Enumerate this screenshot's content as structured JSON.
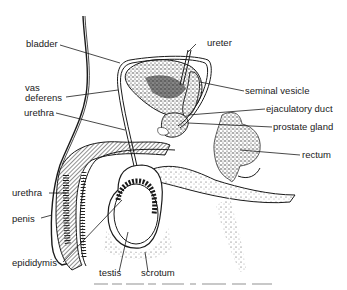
{
  "diagram": {
    "type": "anatomical-illustration",
    "colors": {
      "ink": "#1a1a1a",
      "stipple": "#333333",
      "background": "#ffffff"
    },
    "labels": {
      "bladder": "bladder",
      "ureter": "ureter",
      "vas_deferens_1": "vas",
      "vas_deferens_2": "deferens",
      "seminal_vesicle": "seminal vesicle",
      "ejaculatory_duct": "ejaculatory duct",
      "urethra_upper": "urethra",
      "prostate_gland": "prostate gland",
      "rectum": "rectum",
      "urethra_lower": "urethra",
      "penis": "penis",
      "epididymis": "epididymis",
      "testis": "testis",
      "scrotum": "scrotum"
    }
  }
}
